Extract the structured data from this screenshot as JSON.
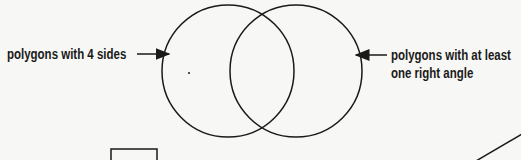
{
  "diagram": {
    "type": "venn",
    "sets": [
      {
        "label": "polygons with 4 sides",
        "cx": 228,
        "cy": 71,
        "r": 66
      },
      {
        "label_line1": "polygons with at least",
        "label_line2": "one right angle",
        "cx": 296,
        "cy": 71,
        "r": 66
      }
    ],
    "colors": {
      "stroke": "#1a1a1a",
      "background": "#f7f7f5"
    }
  }
}
